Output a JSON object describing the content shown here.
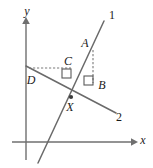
{
  "figure": {
    "background_color": "#ffffff",
    "width": 153,
    "height": 168
  },
  "axes": {
    "x_label": "x",
    "y_label": "y",
    "x_label_pos": {
      "x": 143,
      "y": 141
    },
    "y_label_pos": {
      "x": 27,
      "y": 12
    },
    "x_axis": {
      "x1": 12,
      "y1": 142,
      "x2": 133,
      "y2": 142
    },
    "y_axis": {
      "x1": 26,
      "y1": 160,
      "x2": 26,
      "y2": 22
    },
    "color": "#6f6f6f"
  },
  "lines": [
    {
      "id": "line-1",
      "label": "1",
      "label_pos": {
        "x": 112,
        "y": 16
      },
      "x1": 38,
      "y1": 163,
      "x2": 104,
      "y2": 21,
      "color": "#6a6a6a"
    },
    {
      "id": "line-2",
      "label": "2",
      "label_pos": {
        "x": 119,
        "y": 118
      },
      "x1": 26,
      "y1": 66,
      "x2": 116,
      "y2": 113,
      "color": "#6a6a6a"
    }
  ],
  "points": [
    {
      "id": "point-a",
      "label": "A",
      "x": 93,
      "y": 50,
      "label_pos": {
        "x": 85,
        "y": 44
      },
      "dot": false
    },
    {
      "id": "point-b",
      "label": "B",
      "x": 93,
      "y": 82,
      "label_pos": {
        "x": 102,
        "y": 86
      },
      "dot": false
    },
    {
      "id": "point-c",
      "label": "C",
      "x": 70,
      "y": 69,
      "label_pos": {
        "x": 68,
        "y": 62
      },
      "dot": false
    },
    {
      "id": "point-d",
      "label": "D",
      "x": 29,
      "y": 68,
      "label_pos": {
        "x": 31,
        "y": 81
      },
      "dot": false
    },
    {
      "id": "point-x",
      "label": "X",
      "x": 71,
      "y": 97,
      "label_pos": {
        "x": 70,
        "y": 108
      },
      "dot": true
    }
  ],
  "dashed_segments": [
    {
      "id": "segment-a-b",
      "x1": 93,
      "y1": 50,
      "x2": 93,
      "y2": 83,
      "note": "vertical from A down to B"
    },
    {
      "id": "segment-d-c",
      "x1": 29,
      "y1": 68,
      "x2": 71,
      "y2": 68,
      "note": "horizontal from D across to C"
    }
  ],
  "right_angles": [
    {
      "id": "right-angle-b",
      "x": 83,
      "y": 76,
      "size": 10,
      "note": "at B on line 2"
    },
    {
      "id": "right-angle-c",
      "x": 62,
      "y": 70,
      "size": 10,
      "note": "at C on line 1"
    }
  ],
  "colors": {
    "stroke": "#6a6a6a",
    "axis": "#6f6f6f",
    "label": "#1a1a1a",
    "dash": "#7a7a7a"
  }
}
